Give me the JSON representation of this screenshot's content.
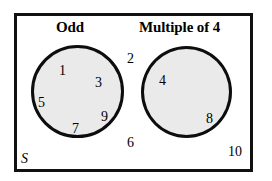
{
  "diagram": {
    "type": "venn-diagram",
    "universe_label": "S",
    "sets": [
      {
        "id": "odd",
        "label": "Odd",
        "members": [
          "1",
          "3",
          "5",
          "7",
          "9"
        ],
        "fill_color": "#eaeaea",
        "stroke_color": "#0d0d0d"
      },
      {
        "id": "multiple-of-4",
        "label": "Multiple of 4",
        "members": [
          "4",
          "8"
        ],
        "fill_color": "#eaeaea",
        "stroke_color": "#0d0d0d"
      }
    ],
    "outside_members": [
      "2",
      "6",
      "10"
    ],
    "elements": {
      "odd_1": "1",
      "odd_3": "3",
      "odd_5": "5",
      "odd_7": "7",
      "odd_9": "9",
      "mult_4": "4",
      "mult_8": "8",
      "outside_2": "2",
      "outside_6": "6",
      "outside_10": "10"
    },
    "border_color": "#111111",
    "background_color": "#ffffff"
  }
}
